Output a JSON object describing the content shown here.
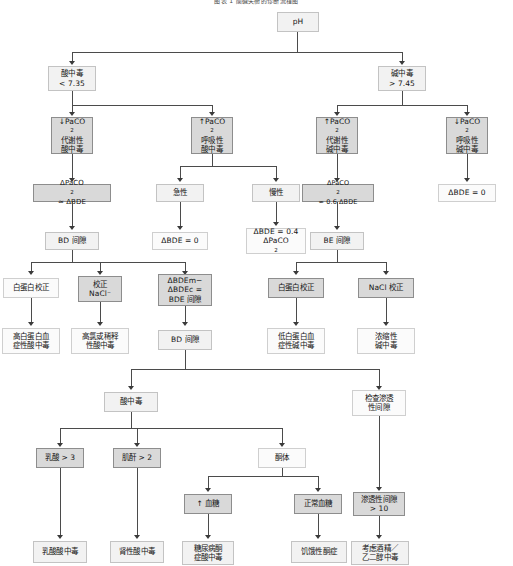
{
  "diagram": {
    "title": "图表 1 酸碱失衡的诊断流程图",
    "root": {
      "label": "pH"
    },
    "nodes": [
      {
        "id": "ph",
        "label": "pH"
      },
      {
        "id": "acidosis",
        "label_line1": "酸中毒",
        "label_line2": "< 7.35"
      },
      {
        "id": "alkalosis",
        "label_line1": "碱中毒",
        "label_line2": "> 7.45"
      },
      {
        "id": "met-acid",
        "label_line1": "↓PaCO2",
        "label_line2": "代谢性",
        "label_line3": "酸中毒"
      },
      {
        "id": "resp-acid",
        "label_line1": "↑PaCO2",
        "label_line2": "呼吸性",
        "label_line3": "酸中毒"
      },
      {
        "id": "met-alk",
        "label_line1": "↑PaCO2",
        "label_line2": "代谢性",
        "label_line3": "碱中毒"
      },
      {
        "id": "resp-alk",
        "label_line1": "↓PaCO2",
        "label_line2": "呼吸性",
        "label_line3": "碱中毒"
      },
      {
        "id": "dpaco2-bde",
        "label": "ΔPaCO2 ≈ ΔBDE"
      },
      {
        "id": "acute",
        "label": "急性"
      },
      {
        "id": "chronic",
        "label": "慢性"
      },
      {
        "id": "dpaco2-06",
        "label": "ΔPaCO2 ≈ 0.6 ΔBDE"
      },
      {
        "id": "dbde-zero-r",
        "label": "ΔBDE = 0"
      },
      {
        "id": "bd-gap-1",
        "label": "BD 间隙"
      },
      {
        "id": "dbde-zero-m",
        "label": "ΔBDE = 0"
      },
      {
        "id": "dbde-04",
        "label_line1": "ΔBDE = 0.4",
        "label_line2": "ΔPaCO2"
      },
      {
        "id": "be-gap",
        "label": "BE 间隙"
      },
      {
        "id": "alb-corr-l",
        "label": "白蛋白校正"
      },
      {
        "id": "nacl-corr-l",
        "label_line1": "校正",
        "label_line2": "NaCl⁻"
      },
      {
        "id": "bdem-bdec",
        "label_line1": "ΔBDEm−",
        "label_line2": "ΔBDEc =",
        "label_line3": "BDE 间隙"
      },
      {
        "id": "alb-corr-r",
        "label": "白蛋白校正"
      },
      {
        "id": "nacl-corr-r",
        "label": "NaCl 校正"
      },
      {
        "id": "hyperalb",
        "label_line1": "高白蛋白血",
        "label_line2": "症性酸中毒"
      },
      {
        "id": "hyperchlor",
        "label_line1": "高氯或稀释",
        "label_line2": "性酸中毒"
      },
      {
        "id": "bd-gap-2",
        "label": "BD 间隙"
      },
      {
        "id": "hypoalb",
        "label_line1": "低白蛋白血",
        "label_line2": "症性碱中毒"
      },
      {
        "id": "contraction",
        "label_line1": "浓缩性",
        "label_line2": "碱中毒"
      },
      {
        "id": "acidosis-2",
        "label": "酸中毒"
      },
      {
        "id": "osm-check",
        "label_line1": "检查渗透",
        "label_line2": "性间隙"
      },
      {
        "id": "lactate",
        "label": "乳酸 > 3"
      },
      {
        "id": "creatinine",
        "label": "肌酐 > 2"
      },
      {
        "id": "ketones",
        "label": "酮体"
      },
      {
        "id": "high-glucose",
        "label": "↑ 血糖"
      },
      {
        "id": "normal-glucose",
        "label": "正常血糖"
      },
      {
        "id": "osm-gap",
        "label_line1": "渗透性间隙",
        "label_line2": "> 10"
      },
      {
        "id": "lactic-acid",
        "label": "乳酸酸中毒"
      },
      {
        "id": "renal-acid",
        "label": "肾性酸中毒"
      },
      {
        "id": "dka",
        "label_line1": "糖尿病酮",
        "label_line2": "症酸中毒"
      },
      {
        "id": "starv-ketosis",
        "label": "饥饿性酮症"
      },
      {
        "id": "alcohol",
        "label_line1": "考虑酒精／",
        "label_line2": "乙二醇中毒"
      }
    ],
    "colors": {
      "shade": "#d9d9d9",
      "light": "#f2f2f2",
      "plain": "#fbfbfb",
      "line": "#4b4b4b",
      "border": "#9a9a9a",
      "text": "#151515"
    }
  }
}
